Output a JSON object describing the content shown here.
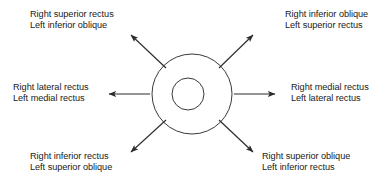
{
  "diagram": {
    "eye": {
      "outer_circle": {
        "cx": 192,
        "cy": 94,
        "r": 40
      },
      "pupil_circle": {
        "cx": 188,
        "cy": 94,
        "r": 16
      },
      "stroke_color": "#3a3a3a"
    },
    "arrow_color": "#2b2b2b",
    "labels": {
      "top_left": {
        "line1": "Right superior rectus",
        "line2": "Left inferior oblique"
      },
      "top_right": {
        "line1": "Right inferior oblique",
        "line2": "Left superior rectus"
      },
      "mid_left": {
        "line1": "Right lateral rectus",
        "line2": "Left medial rectus"
      },
      "mid_right": {
        "line1": "Right medial rectus",
        "line2": "Left lateral rectus"
      },
      "bottom_left": {
        "line1": "Right inferior rectus",
        "line2": "Left superior oblique"
      },
      "bottom_right": {
        "line1": "Right superior oblique",
        "line2": "Left inferior rectus"
      }
    },
    "arrows": [
      {
        "name": "arrow-up-left",
        "x1": 166,
        "y1": 68,
        "x2": 130,
        "y2": 34
      },
      {
        "name": "arrow-up-right",
        "x1": 219,
        "y1": 68,
        "x2": 254,
        "y2": 34
      },
      {
        "name": "arrow-left",
        "x1": 150,
        "y1": 94,
        "x2": 107,
        "y2": 94
      },
      {
        "name": "arrow-right",
        "x1": 234,
        "y1": 94,
        "x2": 277,
        "y2": 94
      },
      {
        "name": "arrow-down-left",
        "x1": 166,
        "y1": 120,
        "x2": 130,
        "y2": 153
      },
      {
        "name": "arrow-down-right",
        "x1": 219,
        "y1": 120,
        "x2": 254,
        "y2": 153
      }
    ]
  }
}
